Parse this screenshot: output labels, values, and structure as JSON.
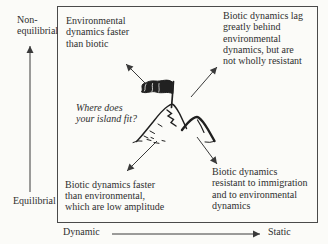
{
  "colors": {
    "paper": "#fbfbf8",
    "ink": "#2f2f2f",
    "border": "#4a4a4a",
    "arrow": "#3a3a3a"
  },
  "y_axis": {
    "top_label_lines": [
      "Non-",
      "equilibrial"
    ],
    "bottom_label": "Equilibrial"
  },
  "x_axis": {
    "left_label": "Dynamic",
    "right_label": "Static"
  },
  "quadrants": {
    "top_left": {
      "lines": [
        "Environmental",
        "dynamics faster",
        "than biotic"
      ]
    },
    "top_right": {
      "lines": [
        "Biotic dynamics lag",
        "greatly behind",
        "environmental",
        "dynamics, but are",
        "not wholly resistant"
      ]
    },
    "bottom_left": {
      "lines": [
        "Biotic dynamics faster",
        "than environmental,",
        "which are low amplitude"
      ]
    },
    "bottom_right": {
      "lines": [
        "Biotic dynamics",
        "resistant to immigration",
        "and to environmental",
        "dynamics"
      ]
    }
  },
  "center": {
    "question_lines": [
      "Where does",
      "your island fit?"
    ]
  },
  "icons": {
    "island": "island-mountain-with-flag"
  }
}
